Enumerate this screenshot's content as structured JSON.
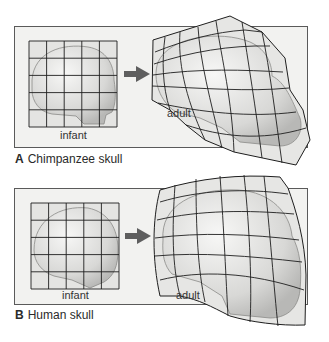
{
  "figure": {
    "panels": [
      {
        "letter": "A",
        "title": "Chimpanzee skull",
        "infant_label": "infant",
        "adult_label": "adult"
      },
      {
        "letter": "B",
        "title": "Human skull",
        "infant_label": "infant",
        "adult_label": "adult"
      }
    ],
    "colors": {
      "panel_bg": "#f2f2f0",
      "panel_border": "#5a5a5a",
      "grid_line": "#1e1e1e",
      "grid_fill": "#e6e6e4",
      "skull_fill": "#dcdcda",
      "arrow": "#5e5e5e"
    }
  }
}
